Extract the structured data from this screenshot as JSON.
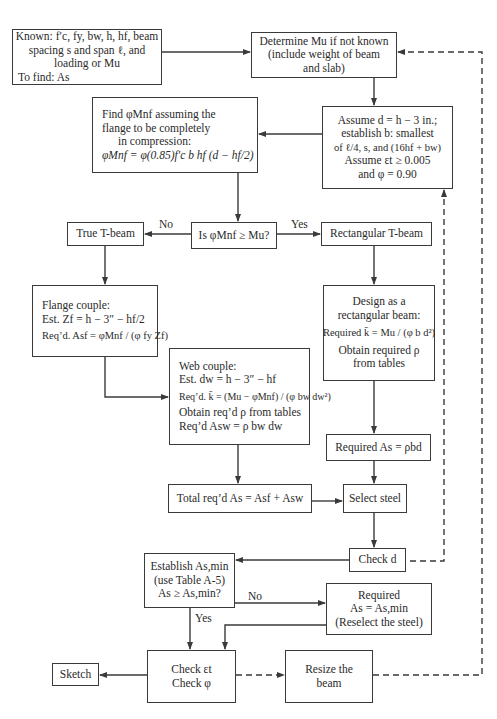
{
  "nodes": {
    "known": {
      "lines": [
        "Known: f′c, fy, bw, h, hf, beam",
        "spacing s and span ℓ, and",
        "loading or Mu",
        "To find: As"
      ]
    },
    "determine_mu": {
      "lines": [
        "Determine Mu if not known",
        "(include weight of beam",
        "and slab)"
      ]
    },
    "find_phi_mnf": {
      "lines": [
        "Find φMnf assuming the",
        "flange to be completely",
        "in compression:"
      ],
      "formula": "φMnf = φ(0.85)f′c b hf (d − hf/2)"
    },
    "assume_d": {
      "lines": [
        "Assume d = h − 3 in.;",
        "establish b: smallest",
        "of ℓ/4, s, and (16hf + bw)",
        "Assume εt ≥ 0.005",
        "and φ = 0.90"
      ]
    },
    "decision_phi_mnf": {
      "text": "Is φMnf ≥ Mu?"
    },
    "true_tbeam": {
      "text": "True T-beam"
    },
    "rect_tbeam": {
      "text": "Rectangular T-beam"
    },
    "flange_couple": {
      "lines": [
        "Flange couple:",
        "Est. Zf = h − 3″ − hf/2"
      ],
      "formula": "Req’d. Asf = φMnf / (φ fy Zf)"
    },
    "web_couple": {
      "lines": [
        "Web couple:",
        "Est. dw = h − 3″ − hf",
        "Obtain req’d ρ from tables",
        "Req’d Asw = ρ bw dw"
      ],
      "formula": "Req’d. k̄ = (Mu − φMnf) / (φ bw dw²)"
    },
    "design_rect": {
      "lines": [
        "Design as a",
        "rectangular beam:",
        "Obtain required ρ",
        "from tables"
      ],
      "formula": "Required k̄ = Mu / (φ b d²)"
    },
    "required_as": {
      "text": "Required As = ρbd"
    },
    "total_as": {
      "text": "Total req’d As = Asf + Asw"
    },
    "select_steel": {
      "text": "Select steel"
    },
    "check_d": {
      "text": "Check d"
    },
    "establish_asmin": {
      "lines": [
        "Establish As,min",
        "(use Table A-5)",
        "As ≥ As,min?"
      ]
    },
    "required_asmin": {
      "lines": [
        "Required",
        "As = As,min",
        "(Reselect the steel)"
      ]
    },
    "check_et": {
      "lines": [
        "Check εt",
        "Check φ"
      ]
    },
    "resize": {
      "lines": [
        "Resize the",
        "beam"
      ]
    },
    "sketch": {
      "text": "Sketch"
    }
  },
  "edge_labels": {
    "no_1": "No",
    "yes_1": "Yes",
    "no_2": "No",
    "yes_2": "Yes"
  },
  "style": {
    "line_color": "#3a3a3a",
    "background": "#ffffff"
  }
}
